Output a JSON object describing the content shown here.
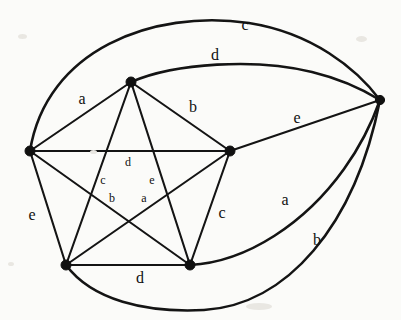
{
  "diagram": {
    "type": "graph-drawing",
    "width": 401,
    "height": 320,
    "background_color": "#fbfbf9",
    "stroke_color": "#141414",
    "vertex_color": "#101010"
  },
  "vertices": [
    {
      "id": "left",
      "name": "vertex-left",
      "x": 30,
      "y": 151,
      "r": 5.0
    },
    {
      "id": "top",
      "name": "vertex-top",
      "x": 131,
      "y": 82,
      "r": 5.0
    },
    {
      "id": "center_right",
      "name": "vertex-center-right",
      "x": 230,
      "y": 151,
      "r": 5.0
    },
    {
      "id": "far_right",
      "name": "vertex-far-right",
      "x": 380,
      "y": 100,
      "r": 4.6
    },
    {
      "id": "bottom_left",
      "name": "vertex-bottom-left",
      "x": 66,
      "y": 265,
      "r": 5.0
    },
    {
      "id": "bottom_right",
      "name": "vertex-bottom-right",
      "x": 190,
      "y": 265,
      "r": 5.0
    }
  ],
  "edges": [
    {
      "name": "edge-left-top",
      "from": "left",
      "to": "top",
      "label": "a",
      "curved": false,
      "path": "M 30 151 L 131 82"
    },
    {
      "name": "edge-top-center-right",
      "from": "top",
      "to": "center_right",
      "label": "b",
      "curved": false,
      "path": "M 131 82 L 230 151"
    },
    {
      "name": "edge-left-center-right",
      "from": "left",
      "to": "center_right",
      "label": "",
      "curved": false,
      "path": "M 30 151 L 230 151"
    },
    {
      "name": "edge-left-bottom-left",
      "from": "left",
      "to": "bottom_left",
      "label": "e",
      "curved": false,
      "path": "M 30 151 L 66 265"
    },
    {
      "name": "edge-left-bottom-right",
      "from": "left",
      "to": "bottom_right",
      "label": "",
      "curved": false,
      "path": "M 30 151 L 190 265"
    },
    {
      "name": "edge-top-bottom-left",
      "from": "top",
      "to": "bottom_left",
      "label": "",
      "curved": false,
      "path": "M 131 82 L 66 265"
    },
    {
      "name": "edge-top-bottom-right",
      "from": "top",
      "to": "bottom_right",
      "label": "",
      "curved": false,
      "path": "M 131 82 L 190 265"
    },
    {
      "name": "edge-center-right-bottom-left",
      "from": "center_right",
      "to": "bottom_left",
      "label": "",
      "curved": false,
      "path": "M 230 151 L 66 265"
    },
    {
      "name": "edge-center-right-bottom-right",
      "from": "center_right",
      "to": "bottom_right",
      "label": "c",
      "curved": false,
      "path": "M 230 151 L 190 265"
    },
    {
      "name": "edge-bottom-left-bottom-right",
      "from": "bottom_left",
      "to": "bottom_right",
      "label": "d",
      "curved": false,
      "path": "M 66 265 L 190 265"
    },
    {
      "name": "edge-center-right-far-right",
      "from": "center_right",
      "to": "far_right",
      "label": "e",
      "curved": false,
      "path": "M 230 151 L 380 100"
    },
    {
      "name": "edge-left-far-right-outer",
      "from": "left",
      "to": "far_right",
      "label": "c",
      "curved": true,
      "path": "M 30 151 C 46 50 152 9 249 23 C 312 33 356 68 380 100"
    },
    {
      "name": "edge-top-far-right-curve",
      "from": "top",
      "to": "far_right",
      "label": "d",
      "curved": true,
      "path": "M 131 82 C 175 63 256 58 312 72 C 345 80 367 92 380 100"
    },
    {
      "name": "edge-bottom-right-far-right",
      "from": "bottom_right",
      "to": "far_right",
      "label": "a",
      "curved": true,
      "path": "M 190 265 C 248 262 306 222 344 169 C 362 144 374 117 380 100"
    },
    {
      "name": "edge-bottom-left-far-right",
      "from": "bottom_left",
      "to": "far_right",
      "label": "b",
      "curved": true,
      "path": "M 66 265 C 92 300 145 313 204 310 C 286 305 355 227 380 100"
    }
  ],
  "labels": {
    "outer": [
      {
        "name": "edge-label-c-top",
        "text": "c",
        "x": 245,
        "y": 25
      },
      {
        "name": "edge-label-d-top",
        "text": "d",
        "x": 215,
        "y": 55
      },
      {
        "name": "edge-label-a-upper-left",
        "text": "a",
        "x": 82,
        "y": 99
      },
      {
        "name": "edge-label-b-upper-right",
        "text": "b",
        "x": 193,
        "y": 107
      },
      {
        "name": "edge-label-e-right",
        "text": "e",
        "x": 297,
        "y": 118
      },
      {
        "name": "edge-label-e-left",
        "text": "e",
        "x": 32,
        "y": 215
      },
      {
        "name": "edge-label-c-lower-middle",
        "text": "c",
        "x": 222,
        "y": 213
      },
      {
        "name": "edge-label-a-lower-right",
        "text": "a",
        "x": 285,
        "y": 200
      },
      {
        "name": "edge-label-b-lower-right",
        "text": "b",
        "x": 317,
        "y": 240
      },
      {
        "name": "edge-label-d-bottom",
        "text": "d",
        "x": 140,
        "y": 278
      }
    ],
    "inner": [
      {
        "name": "edge-label-d-inner",
        "text": "d",
        "x": 128,
        "y": 162
      },
      {
        "name": "edge-label-c-inner",
        "text": "c",
        "x": 103,
        "y": 180
      },
      {
        "name": "edge-label-e-inner",
        "text": "e",
        "x": 152,
        "y": 180
      },
      {
        "name": "edge-label-b-inner",
        "text": "b",
        "x": 112,
        "y": 198
      },
      {
        "name": "edge-label-a-inner",
        "text": "a",
        "x": 144,
        "y": 198
      }
    ]
  },
  "specks": [
    {
      "x": 18,
      "y": 34,
      "w": 9,
      "h": 5
    },
    {
      "x": 356,
      "y": 36,
      "w": 11,
      "h": 6
    },
    {
      "x": 90,
      "y": 150,
      "w": 7,
      "h": 4
    },
    {
      "x": 246,
      "y": 303,
      "w": 26,
      "h": 7
    },
    {
      "x": 8,
      "y": 262,
      "w": 6,
      "h": 4
    }
  ]
}
